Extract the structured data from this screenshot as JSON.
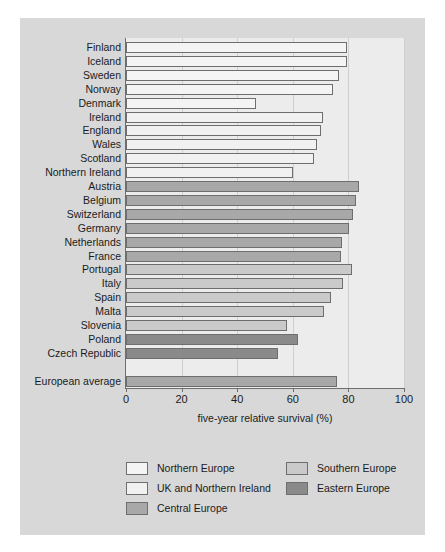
{
  "figure": {
    "background_color": "#ffffff",
    "panel_color": "#d8d8d8",
    "plot_background_color": "#ececec"
  },
  "chart_data": {
    "type": "bar",
    "orientation": "horizontal",
    "title": "",
    "subtitle": "",
    "xlabel": "five-year relative survival (%)",
    "ylabel": "",
    "xlim": [
      0,
      100
    ],
    "xticks": [
      0,
      20,
      40,
      60,
      80,
      100
    ],
    "xticklabels": [
      "0",
      "20",
      "40",
      "60",
      "80",
      "100"
    ],
    "grid": "vertical",
    "legend_position": "below-axes",
    "categories": [
      "Finland",
      "Iceland",
      "Sweden",
      "Norway",
      "Denmark",
      "Ireland",
      "England",
      "Wales",
      "Scotland",
      "Northern Ireland",
      "Austria",
      "Belgium",
      "Switzerland",
      "Germany",
      "Netherlands",
      "France",
      "Portugal",
      "Italy",
      "Spain",
      "Malta",
      "Slovenia",
      "Poland",
      "Czech Republic",
      "European average"
    ],
    "values": [
      79.5,
      79.5,
      76.6,
      74.5,
      46.8,
      70.8,
      70.0,
      68.7,
      67.6,
      60.1,
      83.8,
      82.7,
      81.7,
      80.2,
      77.7,
      77.3,
      81.3,
      78.0,
      73.7,
      71.2,
      57.9,
      61.9,
      54.7,
      75.9
    ],
    "groups": [
      "northern",
      "northern",
      "northern",
      "northern",
      "northern",
      "uk",
      "uk",
      "uk",
      "uk",
      "uk",
      "central",
      "central",
      "central",
      "central",
      "central",
      "central",
      "southern",
      "southern",
      "southern",
      "southern",
      "southern",
      "eastern",
      "eastern",
      "average"
    ],
    "legend": [
      {
        "key": "northern",
        "label": "Northern Europe",
        "color": "#f4f4f4"
      },
      {
        "key": "uk",
        "label": "UK and Northern Ireland",
        "color": "#f1f1f1"
      },
      {
        "key": "central",
        "label": "Central Europe",
        "color": "#a8a8a8"
      },
      {
        "key": "southern",
        "label": "Southern Europe",
        "color": "#cacaca"
      },
      {
        "key": "eastern",
        "label": "Eastern Europe",
        "color": "#8a8a8a"
      }
    ]
  }
}
